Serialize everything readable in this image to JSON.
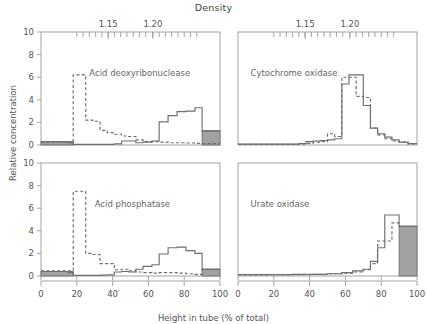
{
  "figure": {
    "top_axis_title": "Density",
    "xlabel": "Height in tube (% of total)",
    "ylabel": "Relative concentration"
  },
  "chart_data": {
    "type": "line",
    "title": "Density",
    "xlabel": "Height in tube (% of total)",
    "ylabel": "Relative concentration",
    "xlim": [
      0,
      100
    ],
    "ylim": [
      0,
      10
    ],
    "yticks": [
      0,
      2,
      4,
      6,
      8,
      10
    ],
    "xticks": [
      0,
      20,
      40,
      60,
      80,
      100
    ],
    "secondary_axis": {
      "label": "Density",
      "position": "top",
      "labeled_ticks": [
        "1.15",
        "1.20"
      ],
      "labeled_tick_x": [
        37.5,
        62.5
      ],
      "minor_tick_x": [
        20,
        23.5,
        27,
        30.5,
        34,
        37.5,
        41,
        44.5,
        48,
        51.5,
        55,
        58.5,
        62.5,
        66,
        69.5,
        73,
        76.5,
        80,
        83.5,
        87
      ]
    },
    "grid": false,
    "legend": "none",
    "series_styles": {
      "solid": "solid line (enzyme distribution A)",
      "dashed": "dashed line (enzyme distribution B)",
      "shaded": "shaded gray region"
    },
    "panels": [
      {
        "id": "acid-deoxyribonuclease",
        "name": "Acid deoxyribonuclease",
        "position": "top-left",
        "series": [
          {
            "name": "dashed",
            "style": "dashed",
            "bin_edges": [
              0,
              5,
              10,
              15,
              18,
              25,
              29,
              33,
              37,
              41,
              45,
              49,
              53,
              57,
              62,
              66,
              71,
              76,
              81,
              86,
              90,
              100
            ],
            "values": [
              0.25,
              0.25,
              0.25,
              0.25,
              6.2,
              2.2,
              2.1,
              1.3,
              1.1,
              0.95,
              0.8,
              0.75,
              0.45,
              0.3,
              0.3,
              0.25,
              0.2,
              0.2,
              0.18,
              0.15,
              0.12
            ]
          },
          {
            "name": "solid",
            "style": "solid",
            "bin_edges": [
              0,
              5,
              10,
              15,
              18,
              25,
              29,
              33,
              37,
              41,
              45,
              49,
              53,
              57,
              62,
              66,
              71,
              76,
              81,
              86,
              90,
              100
            ],
            "values": [
              0.3,
              0.3,
              0.3,
              0.2,
              0.05,
              0.05,
              0.05,
              0.05,
              0.05,
              0.1,
              0.35,
              0.35,
              0.2,
              0.25,
              0.35,
              2.05,
              2.6,
              2.95,
              3.0,
              3.3,
              1.25
            ]
          }
        ],
        "shaded_regions": [
          {
            "x0": 0,
            "x1": 18,
            "y": 0.3
          },
          {
            "x0": 90,
            "x1": 100,
            "y": 1.25
          }
        ]
      },
      {
        "id": "cytochrome-oxidase",
        "name": "Cytochrome oxidase",
        "position": "top-right",
        "series": [
          {
            "name": "dashed",
            "style": "dashed",
            "bin_edges": [
              0,
              34,
              38,
              42,
              46,
              50,
              54,
              58,
              62,
              66,
              70,
              74,
              78,
              82,
              86,
              90,
              95,
              100
            ],
            "values": [
              0.05,
              0.1,
              0.15,
              0.25,
              0.3,
              1.0,
              0.75,
              6.0,
              6.0,
              4.3,
              4.2,
              1.5,
              0.9,
              0.55,
              0.35,
              0.25,
              0.1
            ]
          },
          {
            "name": "solid",
            "style": "solid",
            "bin_edges": [
              0,
              34,
              38,
              42,
              46,
              50,
              54,
              58,
              62,
              66,
              70,
              74,
              78,
              82,
              86,
              90,
              95,
              100
            ],
            "values": [
              0.08,
              0.12,
              0.3,
              0.35,
              0.4,
              0.45,
              0.55,
              5.4,
              6.2,
              6.2,
              3.5,
              1.5,
              1.0,
              0.7,
              0.45,
              0.25,
              0.12
            ]
          }
        ],
        "shaded_regions": []
      },
      {
        "id": "acid-phosphatase",
        "name": "Acid phosphatase",
        "position": "bottom-left",
        "series": [
          {
            "name": "dashed",
            "style": "dashed",
            "bin_edges": [
              0,
              5,
              10,
              15,
              18,
              25,
              29,
              33,
              37,
              41,
              45,
              49,
              53,
              57,
              62,
              66,
              71,
              76,
              81,
              86,
              90,
              100
            ],
            "values": [
              0.45,
              0.45,
              0.45,
              0.45,
              7.5,
              2.0,
              1.9,
              1.1,
              1.1,
              0.55,
              0.6,
              0.45,
              0.35,
              0.3,
              0.25,
              0.3,
              0.3,
              0.25,
              0.2,
              0.15,
              0.6
            ]
          },
          {
            "name": "solid",
            "style": "solid",
            "bin_edges": [
              0,
              5,
              10,
              15,
              18,
              25,
              29,
              33,
              37,
              41,
              45,
              49,
              53,
              57,
              62,
              66,
              71,
              76,
              81,
              86,
              90,
              100
            ],
            "values": [
              0.4,
              0.4,
              0.4,
              0.3,
              0.05,
              0.05,
              0.05,
              0.08,
              0.1,
              0.35,
              0.4,
              0.35,
              0.6,
              0.85,
              1.0,
              1.95,
              2.5,
              2.55,
              2.25,
              2.0,
              0.6
            ]
          }
        ],
        "shaded_regions": [
          {
            "x0": 0,
            "x1": 18,
            "y": 0.4
          },
          {
            "x0": 90,
            "x1": 100,
            "y": 0.6
          }
        ]
      },
      {
        "id": "urate-oxidase",
        "name": "Urate oxidase",
        "position": "bottom-right",
        "series": [
          {
            "name": "dashed",
            "style": "dashed",
            "bin_edges": [
              0,
              18,
              30,
              42,
              50,
              58,
              64,
              70,
              74,
              78,
              82,
              86,
              90,
              100
            ],
            "values": [
              0.1,
              0.12,
              0.12,
              0.15,
              0.2,
              0.25,
              0.35,
              0.55,
              1.1,
              3.1,
              3.1,
              4.7,
              4.4
            ]
          },
          {
            "name": "solid",
            "style": "solid",
            "bin_edges": [
              0,
              18,
              30,
              42,
              50,
              58,
              64,
              70,
              74,
              78,
              82,
              86,
              90,
              100
            ],
            "values": [
              0.12,
              0.12,
              0.15,
              0.15,
              0.2,
              0.3,
              0.45,
              0.6,
              1.3,
              2.5,
              5.4,
              5.4,
              4.4
            ]
          }
        ],
        "shaded_regions": [
          {
            "x0": 90,
            "x1": 100,
            "y": 4.4
          }
        ]
      }
    ]
  }
}
